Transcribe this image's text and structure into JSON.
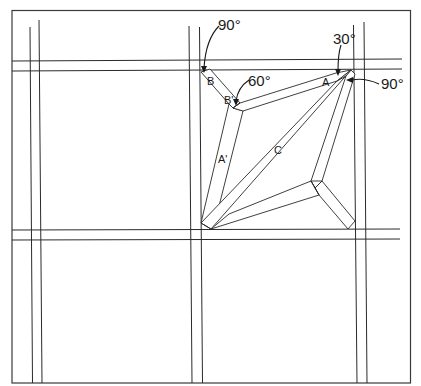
{
  "diagram": {
    "type": "miter-joint-layout",
    "colors": {
      "line": "#2a2a2a",
      "background": "#ffffff"
    },
    "angle_labels": {
      "top_left": "90°",
      "inner_left": "60°",
      "top_right_acute": "30°",
      "top_right_corner": "90°"
    },
    "part_labels": {
      "b": "B",
      "b_prime": "B'",
      "a": "A",
      "a_prime": "A'",
      "c": "C"
    }
  }
}
